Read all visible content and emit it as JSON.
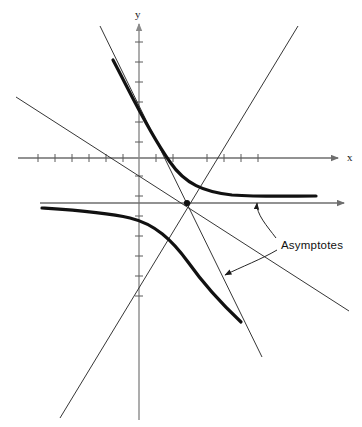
{
  "figure": {
    "type": "math-graph",
    "background_color": "#ffffff"
  },
  "axes": {
    "x_axis": {
      "label": "x",
      "label_x": 348,
      "label_y": 160,
      "color": "#6e6e6e",
      "y_pixel": 158,
      "x_start": 18,
      "x_end": 340,
      "arrow": "right",
      "ticks_left": [
        38,
        55,
        72,
        89,
        106,
        123
      ],
      "ticks_right": [
        155,
        172,
        206,
        223,
        240,
        257
      ]
    },
    "y_axis": {
      "label": "y",
      "label_x": 136,
      "label_y": 16,
      "color": "#8a8a8a",
      "x_pixel": 139,
      "y_start": 22,
      "y_end": 420,
      "arrow": "up",
      "ticks_above": [
        42,
        62,
        82,
        102,
        122,
        142
      ],
      "ticks_below": [
        176,
        196,
        216,
        236,
        256,
        276,
        296
      ]
    },
    "origin": {
      "x": 139,
      "y": 158
    }
  },
  "hyperbola": {
    "center": {
      "x": 187,
      "y": 203
    },
    "stroke_color": "#111111",
    "stroke_width": 3.2,
    "upper_branch": {
      "start": {
        "x": 113,
        "y": 60
      },
      "end": {
        "x": 316,
        "y": 196
      },
      "path": "M113,60 C130,92 148,131 170,162 C185,184 204,192 232,195 C262,197 292,196 316,196"
    },
    "lower_branch": {
      "start": {
        "x": 42,
        "y": 208
      },
      "end": {
        "x": 241,
        "y": 322
      },
      "path": "M42,208 C72,210 104,212 130,218 C155,224 172,240 188,262 C205,286 224,306 241,322"
    }
  },
  "asymptotes": {
    "label": "Asymptotes",
    "label_position": {
      "x": 281,
      "y": 245
    },
    "stroke_color": "#2b2b2b",
    "stroke_width": 0.9,
    "descending_line": {
      "from": {
        "x": 16,
        "y": 97
      },
      "to": {
        "x": 349,
        "y": 311
      },
      "direction": "falling"
    },
    "ascending_line": {
      "from": {
        "x": 60,
        "y": 418
      },
      "to": {
        "x": 298,
        "y": 26
      },
      "direction": "rising"
    },
    "horizontal_asymptote": {
      "y": 203,
      "x_start": 40,
      "x_end": 346,
      "color": "#6e6e6e",
      "arrow": "right"
    },
    "steep_line": {
      "from": {
        "x": 100,
        "y": 26
      },
      "to": {
        "x": 262,
        "y": 357
      },
      "direction": "falling-steep"
    },
    "leader_arrow_upper": {
      "tip": {
        "x": 257,
        "y": 200
      },
      "path": "M275,238 C266,226 256,212 257,201",
      "points_to": "horizontal-asymptote"
    },
    "leader_arrow_lower": {
      "tip": {
        "x": 223,
        "y": 276
      },
      "path": "M276,250 C262,258 240,266 224,275",
      "points_to": "descending-asymptote"
    }
  }
}
